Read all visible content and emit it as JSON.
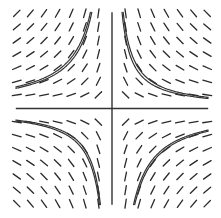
{
  "diagram": {
    "type": "slope-field",
    "equation": "dy/dx = -y/x",
    "x_range": [
      -7,
      7
    ],
    "y_range": [
      -7,
      7
    ],
    "grid_points_x": [
      -7,
      -6,
      -5,
      -4,
      -3,
      -2,
      -1,
      1,
      2,
      3,
      4,
      5,
      6,
      7
    ],
    "grid_points_y": [
      -7,
      -6,
      -5,
      -4,
      -3,
      -2,
      -1,
      1,
      2,
      3,
      4,
      5,
      6,
      7
    ],
    "solution_curves": [
      {
        "quadrant": "I",
        "xy_constant": 5.2
      },
      {
        "quadrant": "I",
        "xy_constant": 5.8
      },
      {
        "quadrant": "II",
        "xy_constant": -10.5
      },
      {
        "quadrant": "II",
        "xy_constant": -11.2
      },
      {
        "quadrant": "III",
        "xy_constant": 6.0
      },
      {
        "quadrant": "III",
        "xy_constant": 6.5
      },
      {
        "quadrant": "IV",
        "xy_constant": -11.2
      },
      {
        "quadrant": "IV",
        "xy_constant": -11.8
      }
    ],
    "colors": {
      "segment": "#2a2a2a",
      "axis": "#333333",
      "curve": "#333333",
      "background": "#ffffff"
    }
  }
}
